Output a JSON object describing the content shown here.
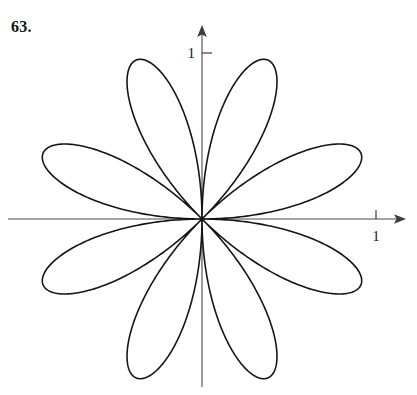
{
  "figure": {
    "problem_number": "63.",
    "background_color": "#ffffff",
    "ink_color": "#151515",
    "axis_color": "#4a4a4a"
  },
  "axes": {
    "x_axis": {
      "name": "x-axis",
      "tick_label": "1",
      "tick_value": 1,
      "arrow": "right-arrowhead"
    },
    "y_axis": {
      "name": "y-axis",
      "tick_label": "1",
      "tick_value": 1,
      "arrow": "up-arrowhead"
    }
  },
  "chart_data": {
    "type": "line",
    "title": "",
    "subtitle": "",
    "xlabel": "",
    "ylabel": "",
    "plot_kind": "polar-rose",
    "grid": false,
    "legend": false,
    "coordinate_system": "polar",
    "equation": "r = cos(4θ - π/2)",
    "petal_count": 8,
    "max_radius": 1,
    "xlim": [
      -1.18,
      1.18
    ],
    "ylim": [
      -1.18,
      1.18
    ],
    "xticks": [
      1
    ],
    "xtick_labels": [
      "1"
    ],
    "yticks": [
      1
    ],
    "ytick_labels": [
      "1"
    ],
    "petal_tip_angles_deg": [
      22.5,
      67.5,
      112.5,
      157.5,
      202.5,
      247.5,
      292.5,
      337.5
    ],
    "petal_tip_radius": 1,
    "petal_tips_xy": [
      [
        0.924,
        0.383
      ],
      [
        0.383,
        0.924
      ],
      [
        -0.383,
        0.924
      ],
      [
        -0.924,
        0.383
      ],
      [
        -0.924,
        -0.383
      ],
      [
        -0.383,
        -0.924
      ],
      [
        0.383,
        -0.924
      ],
      [
        0.924,
        -0.383
      ]
    ],
    "series": [
      {
        "name": "rose-curve",
        "color": "#151515",
        "linewidth": 1.6,
        "closed": true
      }
    ],
    "render": {
      "origin_px": [
        202,
        219
      ],
      "unit_px": 172,
      "theta_samples": 1440
    }
  }
}
